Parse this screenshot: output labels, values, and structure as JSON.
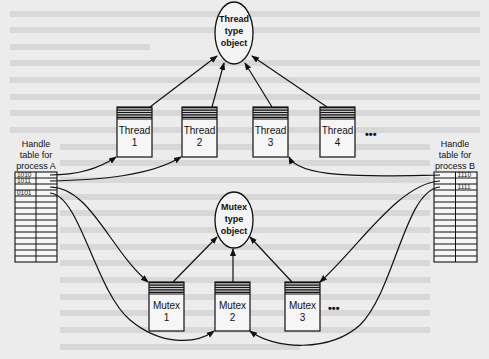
{
  "thread_type_object": {
    "lines": [
      "Thread",
      "type",
      "object"
    ]
  },
  "mutex_type_object": {
    "lines": [
      "Mutex",
      "type",
      "object"
    ]
  },
  "threads": [
    {
      "name": "Thread",
      "num": "1"
    },
    {
      "name": "Thread",
      "num": "2"
    },
    {
      "name": "Thread",
      "num": "3"
    },
    {
      "name": "Thread",
      "num": "4"
    }
  ],
  "threads_more": "•••",
  "mutexes": [
    {
      "name": "Mutex",
      "num": "1"
    },
    {
      "name": "Mutex",
      "num": "2"
    },
    {
      "name": "Mutex",
      "num": "3"
    }
  ],
  "mutexes_more": "•••",
  "handle_table_a": {
    "label": [
      "Handle",
      "table for",
      "process A"
    ],
    "entries": [
      "1010",
      "1011",
      "",
      "0101",
      "",
      "",
      "",
      "",
      "",
      "",
      "",
      "",
      "",
      "",
      ""
    ]
  },
  "handle_table_b": {
    "label": [
      "Handle",
      "table for",
      "process B"
    ],
    "entries": [
      "1110",
      "",
      "1111",
      "",
      "",
      "",
      "",
      "",
      "",
      "",
      "",
      "",
      "",
      "",
      ""
    ]
  }
}
